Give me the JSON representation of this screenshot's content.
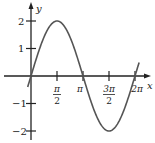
{
  "chart_data": {
    "type": "line",
    "title": "",
    "function": "y = 2 sin x",
    "xlabel": "x",
    "ylabel": "y",
    "xlim": [
      0,
      6.2832
    ],
    "ylim": [
      -2,
      2
    ],
    "x_ticks": [
      "π/2",
      "π",
      "3π/2",
      "2π"
    ],
    "y_ticks": [
      "2",
      "1",
      "-1",
      "-2"
    ],
    "x": [
      0,
      0.7854,
      1.5708,
      2.3562,
      3.1416,
      3.927,
      4.7124,
      5.4978,
      6.2832
    ],
    "series": [
      {
        "name": "y = 2 sin x",
        "values": [
          0,
          1.414,
          2,
          1.414,
          0,
          -1.414,
          -2,
          -1.414,
          0
        ]
      }
    ],
    "grid": false,
    "legend": "none"
  },
  "labels": {
    "x_axis": "x",
    "y_axis": "y",
    "tick_pi_over_2_num": "π",
    "tick_pi_over_2_den": "2",
    "tick_pi": "π",
    "tick_3pi_over_2_num": "3π",
    "tick_3pi_over_2_den": "2",
    "tick_2pi": "2π",
    "y_tick_2": "2",
    "y_tick_1": "1",
    "y_tick_m1": "−1",
    "y_tick_m2": "−2"
  },
  "colors": {
    "curve": "#555555",
    "axis": "#222222"
  }
}
